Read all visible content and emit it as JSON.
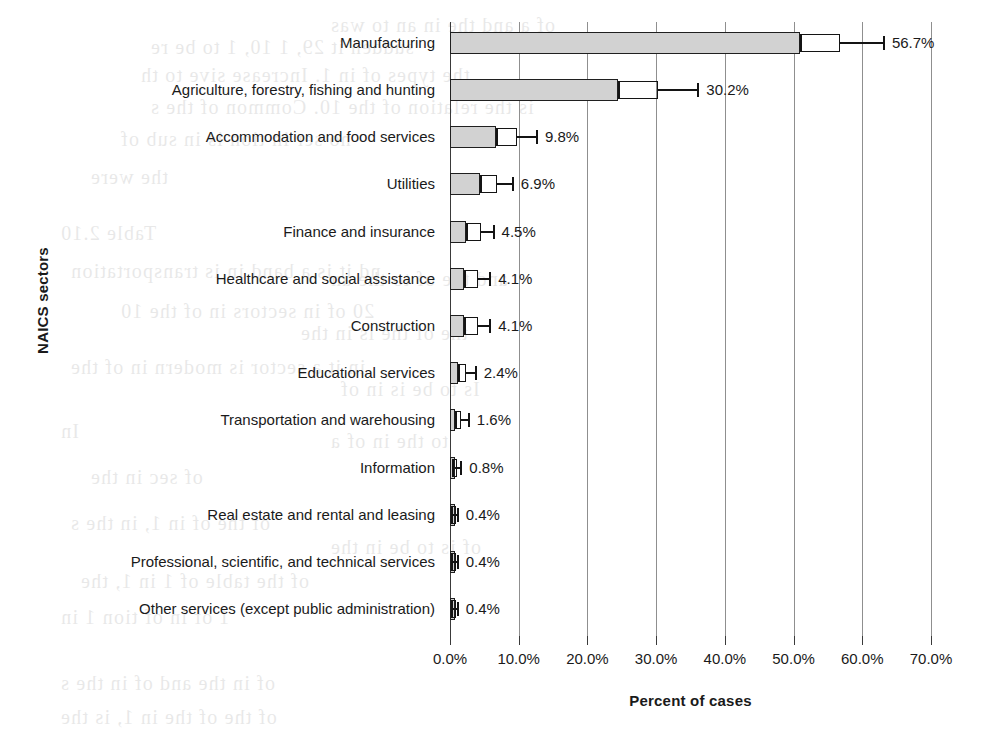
{
  "chart_data": {
    "type": "bar",
    "orientation": "horizontal",
    "title": "",
    "xlabel": "Percent of cases",
    "ylabel": "NAICS sectors",
    "xlim": [
      0,
      70
    ],
    "xtick_labels": [
      "0.0%",
      "10.0%",
      "20.0%",
      "30.0%",
      "40.0%",
      "50.0%",
      "60.0%",
      "70.0%"
    ],
    "xtick_values": [
      0,
      10,
      20,
      30,
      40,
      50,
      60,
      70
    ],
    "grid": "vertical",
    "legend": "none",
    "units": "percent",
    "categories": [
      "Manufacturing",
      "Agriculture, forestry, fishing and hunting",
      "Accommodation and food services",
      "Utilities",
      "Finance and insurance",
      "Healthcare and social assistance",
      "Construction",
      "Educational services",
      "Transportation and warehousing",
      "Information",
      "Real estate and rental and leasing",
      "Professional, scientific, and technical services",
      "Other services (except public administration)"
    ],
    "values": [
      56.7,
      30.2,
      9.8,
      6.9,
      4.5,
      4.1,
      4.1,
      2.4,
      1.6,
      0.8,
      0.4,
      0.4,
      0.4
    ],
    "value_labels": [
      "56.7%",
      "30.2%",
      "9.8%",
      "6.9%",
      "4.5%",
      "4.1%",
      "4.1%",
      "2.4%",
      "1.6%",
      "0.8%",
      "0.4%",
      "0.4%",
      "0.4%"
    ],
    "bar_ends": [
      51.0,
      24.5,
      6.7,
      4.3,
      2.4,
      2.0,
      2.0,
      1.1,
      0.7,
      0.35,
      0.2,
      0.2,
      0.2
    ],
    "error_boxes": [
      [
        51.0,
        56.7
      ],
      [
        24.5,
        30.2
      ],
      [
        6.7,
        9.8
      ],
      [
        4.3,
        6.9
      ],
      [
        2.4,
        4.5
      ],
      [
        2.0,
        4.1
      ],
      [
        2.0,
        4.1
      ],
      [
        1.1,
        2.4
      ],
      [
        0.7,
        1.6
      ],
      [
        0.35,
        0.8
      ],
      [
        0.2,
        0.4
      ],
      [
        0.2,
        0.4
      ],
      [
        0.2,
        0.4
      ]
    ],
    "error_whisker_upper": [
      63.0,
      36.0,
      12.5,
      9.0,
      6.2,
      5.7,
      5.7,
      3.6,
      2.6,
      1.5,
      0.9,
      0.9,
      0.9
    ],
    "colors": {
      "bar_fill": "#d2d2d2",
      "bar_border": "#1f1f1f",
      "gridline": "#8f8f8f",
      "axis": "#3a3a3a",
      "text": "#1a1a1a",
      "background": "#ffffff"
    }
  },
  "bleed_text": [
    {
      "x": 330,
      "y": 14,
      "text": "of a and the in an to was"
    },
    {
      "x": 150,
      "y": 36,
      "text": "sudden it 29, 1 10, 1 to be re"
    },
    {
      "x": 140,
      "y": 64,
      "text": "the types of in 1. Increase sive to th"
    },
    {
      "x": 150,
      "y": 96,
      "text": "is the relation of the 10. Common of the s"
    },
    {
      "x": 120,
      "y": 128,
      "text": "no ser in tion is in sub of"
    },
    {
      "x": 90,
      "y": 166,
      "text": "the were"
    },
    {
      "x": 60,
      "y": 222,
      "text": "Table 2.10"
    },
    {
      "x": 70,
      "y": 260,
      "text": "nd it is a band in is transportation"
    },
    {
      "x": 330,
      "y": 268,
      "text": "and the of to the an"
    },
    {
      "x": 120,
      "y": 300,
      "text": "20 of in sectors in of the 10"
    },
    {
      "x": 300,
      "y": 322,
      "text": "the of the is in the"
    },
    {
      "x": 70,
      "y": 356,
      "text": "in it a sector is modern in of the"
    },
    {
      "x": 340,
      "y": 378,
      "text": "Is to be is in of"
    },
    {
      "x": 60,
      "y": 420,
      "text": "In"
    },
    {
      "x": 330,
      "y": 430,
      "text": "to the in of a"
    },
    {
      "x": 90,
      "y": 466,
      "text": "of sec in the"
    },
    {
      "x": 70,
      "y": 512,
      "text": "of the of in 1, in the s"
    },
    {
      "x": 330,
      "y": 536,
      "text": "of is to be in the"
    },
    {
      "x": 80,
      "y": 570,
      "text": "of the table of 1 in 1, the"
    },
    {
      "x": 60,
      "y": 606,
      "text": "1 of in of tion 1 in"
    },
    {
      "x": 60,
      "y": 672,
      "text": "of in the and of in the s"
    },
    {
      "x": 60,
      "y": 706,
      "text": "of the of the in 1, is the"
    }
  ]
}
